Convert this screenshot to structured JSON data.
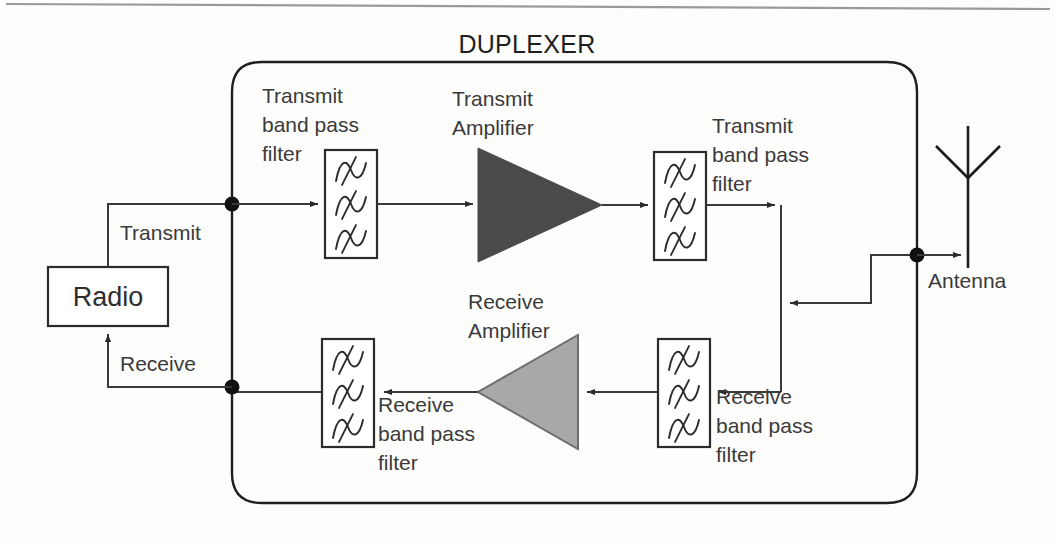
{
  "diagram": {
    "title": "DUPLEXER",
    "colors": {
      "transmit_amplifier_fill": "#4a4a4a",
      "receive_amplifier_fill": "#a8a8a8",
      "wire": "#3a3a3a",
      "outline": "#2b2b2b",
      "background": "#fdfdfc"
    },
    "nodes": {
      "radio": {
        "label": "Radio"
      },
      "antenna": {
        "label": "Antenna"
      },
      "transmit_path_label": {
        "label": "Transmit"
      },
      "receive_path_label": {
        "label": "Receive"
      },
      "transmit_bpf_in": {
        "line1": "Transmit",
        "line2": "band pass",
        "line3": "filter"
      },
      "transmit_amplifier": {
        "line1": "Transmit",
        "line2": "Amplifier"
      },
      "transmit_bpf_out": {
        "line1": "Transmit",
        "line2": "band pass",
        "line3": "filter"
      },
      "receive_bpf_in": {
        "line1": "Receive",
        "line2": "band pass",
        "line3": "filter"
      },
      "receive_amplifier": {
        "line1": "Receive",
        "line2": "Amplifier"
      },
      "receive_bpf_out": {
        "line1": "Receive",
        "line2": "band pass",
        "line3": "filter"
      }
    },
    "icons": {
      "bandpass_filter": "bandpass-filter-icon",
      "amplifier": "amplifier-triangle-icon",
      "antenna": "antenna-icon",
      "junction": "junction-dot-icon"
    }
  }
}
